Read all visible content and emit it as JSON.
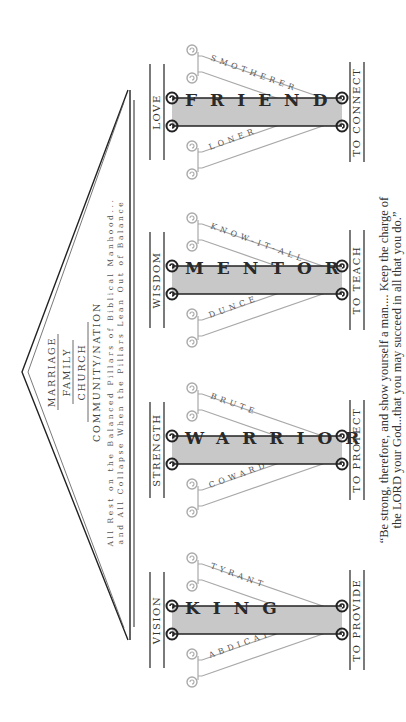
{
  "roof": {
    "tiers": [
      "MARRIAGE",
      "FAMILY",
      "CHURCH",
      "COMMUNITY/NATION"
    ],
    "caption_line1": "All Rest on the Balanced Pillars of Biblical Manhood...",
    "caption_line2": "and All Collapse When the Pillars Lean Out of Balance"
  },
  "pillars": [
    {
      "name": "KING",
      "top_label": "VISION",
      "bottom_label": "TO PROVIDE",
      "lean_left": "ABDICATOR",
      "lean_right": "TYRANT"
    },
    {
      "name": "WARRIOR",
      "top_label": "STRENGTH",
      "bottom_label": "TO PROTECT",
      "lean_left": "COWARD",
      "lean_right": "BRUTE"
    },
    {
      "name": "MENTOR",
      "top_label": "WISDOM",
      "bottom_label": "TO TEACH",
      "lean_left": "DUNCE",
      "lean_right": "KNOW-IT-ALL"
    },
    {
      "name": "FRIEND",
      "top_label": "LOVE",
      "bottom_label": "TO CONNECT",
      "lean_left": "LONER",
      "lean_right": "SMOTHERER"
    }
  ],
  "quote": {
    "line1": "“Be strong, therefore, and show yourself a man.... Keep the charge of",
    "line2": "the LORD your God...that you may succeed in all that you do.”"
  },
  "colors": {
    "pillar_fill": "#c8c8c8",
    "pillar_outline": "#222222",
    "lean_outline": "#9a9a9a",
    "text": "#333333"
  }
}
